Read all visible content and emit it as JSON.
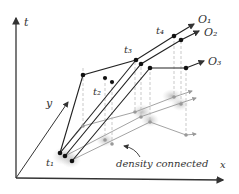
{
  "diagram": {
    "axes": {
      "t_label": "t",
      "x_label": "x",
      "y_label": "y"
    },
    "time_labels": [
      "t₁",
      "t₂",
      "t₃",
      "t₄"
    ],
    "objects": [
      "O₁",
      "O₂",
      "O₃"
    ],
    "annotation": "density connected",
    "colors": {
      "axis": "#333333",
      "trajectory": "#222222",
      "projection": "#aaaaaa",
      "cluster": "#cccccc",
      "dot": "#111111"
    }
  }
}
